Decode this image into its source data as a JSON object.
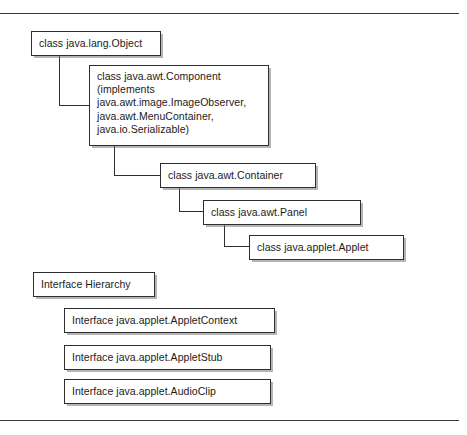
{
  "figure": {
    "type": "class-hierarchy-diagram",
    "text_color": "#1b1b1b",
    "border_color": "#2e2e2e",
    "background_color": "#ffffff",
    "rule_color": "#3a3a3a"
  },
  "rules": {
    "top_label": "top-divider-rule",
    "bottom_label": "bottom-divider-rule"
  },
  "class_hierarchy": {
    "nodes": [
      {
        "id": "object",
        "label": "class java.lang.Object",
        "level": 0
      },
      {
        "id": "component",
        "label": "   class java.awt.Component\n(implements\njava.awt.image.ImageObserver,\njava.awt.MenuContainer,\njava.io.Serializable)",
        "level": 1
      },
      {
        "id": "container",
        "label": "class java.awt.Container",
        "level": 2
      },
      {
        "id": "panel",
        "label": "class java.awt.Panel",
        "level": 3
      },
      {
        "id": "applet",
        "label": "class java.applet.Applet",
        "level": 4
      }
    ]
  },
  "interface_hierarchy": {
    "heading": "Interface Hierarchy",
    "nodes": [
      {
        "id": "appletcontext",
        "label": "Interface java.applet.AppletContext"
      },
      {
        "id": "appletstub",
        "label": "Interface java.applet.AppletStub"
      },
      {
        "id": "audioclip",
        "label": "Interface java.applet.AudioClip"
      }
    ]
  }
}
